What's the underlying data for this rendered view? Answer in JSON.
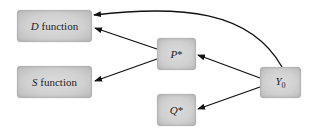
{
  "nodes": {
    "d_function": {
      "var": "D",
      "suffix": " function"
    },
    "s_function": {
      "var": "S",
      "suffix": " function"
    },
    "p_star": {
      "var": "P",
      "suffix": "*"
    },
    "q_star": {
      "var": "Q",
      "suffix": "*"
    },
    "y0": {
      "var": "Y",
      "sub": "0"
    }
  },
  "edges": [
    {
      "from": "Y0",
      "to": "D function"
    },
    {
      "from": "P*",
      "to": "D function"
    },
    {
      "from": "P*",
      "to": "S function"
    },
    {
      "from": "Y0",
      "to": "P*"
    },
    {
      "from": "Y0",
      "to": "Q*"
    }
  ]
}
